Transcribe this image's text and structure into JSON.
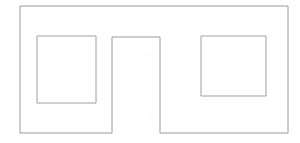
{
  "document": {
    "title": "Rectangular outline with notch and two inner squares",
    "background_color": "#ffffff",
    "width": 300,
    "height": 143
  },
  "style": {
    "stroke_color": "#9a9a9a",
    "inner_stroke_color": "#9e9e9e",
    "fill_color": "#ffffff",
    "stroke_width": 1,
    "speck_color": "#e6e6e6"
  },
  "figure": {
    "type": "line-drawing",
    "shapes": [
      {
        "name": "outer-outline",
        "kind": "polygon-with-bottom-notch",
        "description": "Large rectangle whose bottom edge is interrupted by an upward rectangular notch at the horizontal center",
        "bounds": {
          "x": 20,
          "y": 6,
          "width": 268,
          "height": 127
        },
        "notch": {
          "x": 112,
          "y": 37,
          "width": 48,
          "height": 96
        },
        "points": "20,6 288,6 288,133 160,133 160,37 112,37 112,133 20,133"
      },
      {
        "name": "inner-square-left",
        "kind": "rectangle",
        "bounds": {
          "x": 37,
          "y": 36,
          "width": 59,
          "height": 67
        }
      },
      {
        "name": "inner-square-right",
        "kind": "rectangle",
        "bounds": {
          "x": 201,
          "y": 36,
          "width": 65,
          "height": 60
        }
      }
    ],
    "specks": [
      {
        "x": 26,
        "y": 44,
        "r": 0.8
      },
      {
        "x": 31,
        "y": 97,
        "r": 0.7
      },
      {
        "x": 58,
        "y": 17,
        "r": 0.7
      },
      {
        "x": 104,
        "y": 31,
        "r": 0.8
      },
      {
        "x": 127,
        "y": 24,
        "r": 0.7
      },
      {
        "x": 147,
        "y": 54,
        "r": 0.7
      },
      {
        "x": 151,
        "y": 118,
        "r": 0.7
      },
      {
        "x": 180,
        "y": 12,
        "r": 0.7
      },
      {
        "x": 193,
        "y": 88,
        "r": 0.8
      },
      {
        "x": 216,
        "y": 122,
        "r": 0.7
      },
      {
        "x": 242,
        "y": 30,
        "r": 0.7
      },
      {
        "x": 271,
        "y": 68,
        "r": 0.8
      },
      {
        "x": 281,
        "y": 110,
        "r": 0.7
      },
      {
        "x": 88,
        "y": 128,
        "r": 0.7
      },
      {
        "x": 46,
        "y": 124,
        "r": 0.7
      }
    ]
  }
}
